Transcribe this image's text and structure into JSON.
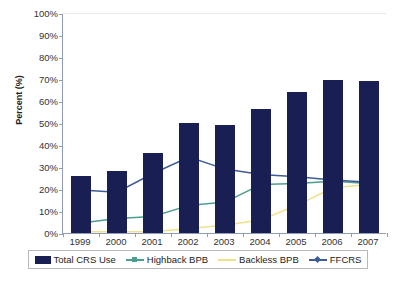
{
  "chart_data": {
    "type": "bar",
    "title": "",
    "xlabel": "",
    "ylabel": "Percent (%)",
    "ylim": [
      0,
      100
    ],
    "ytick_labels": [
      "100%",
      "90%",
      "80%",
      "70%",
      "60%",
      "50%",
      "40%",
      "30%",
      "20%",
      "10%",
      "0%"
    ],
    "ytick_values": [
      100,
      90,
      80,
      70,
      60,
      50,
      40,
      30,
      20,
      10,
      0
    ],
    "categories": [
      "1999",
      "2000",
      "2001",
      "2002",
      "2003",
      "2004",
      "2005",
      "2006",
      "2007"
    ],
    "grid": false,
    "legend_position": "bottom",
    "series": [
      {
        "name": "Total CRS Use",
        "kind": "bar",
        "color": "#191f52",
        "values": [
          26,
          28,
          36.5,
          50,
          49,
          56.5,
          64,
          69.5,
          69
        ]
      },
      {
        "name": "Highback BPB",
        "kind": "line",
        "color": "#4e9e8f",
        "marker": "cross",
        "values": [
          5,
          7,
          8,
          13,
          14.5,
          22.5,
          23,
          24,
          23
        ]
      },
      {
        "name": "Backless BPB",
        "kind": "line",
        "color": "#efe08a",
        "marker": "none",
        "values": [
          1,
          1,
          1,
          2.5,
          4,
          6.5,
          13,
          21,
          22.5
        ]
      },
      {
        "name": "FFCRS",
        "kind": "line",
        "color": "#3f5c96",
        "marker": "diamond",
        "values": [
          20,
          19,
          27.5,
          35,
          29.5,
          27,
          26,
          24.5,
          23.5
        ]
      }
    ]
  },
  "legend": {
    "items": [
      {
        "label": "Total CRS Use",
        "swatch": "bar-swatch",
        "color": "#191f52"
      },
      {
        "label": "Highback BPB",
        "swatch": "line-swatch",
        "color": "#4e9e8f"
      },
      {
        "label": "Backless BPB",
        "swatch": "line-swatch",
        "color": "#efe08a"
      },
      {
        "label": "FFCRS",
        "swatch": "line-swatch",
        "color": "#3f5c96"
      }
    ]
  },
  "axes": {
    "y_title": "Percent (%)",
    "axis_color": "#8f9dbb"
  }
}
